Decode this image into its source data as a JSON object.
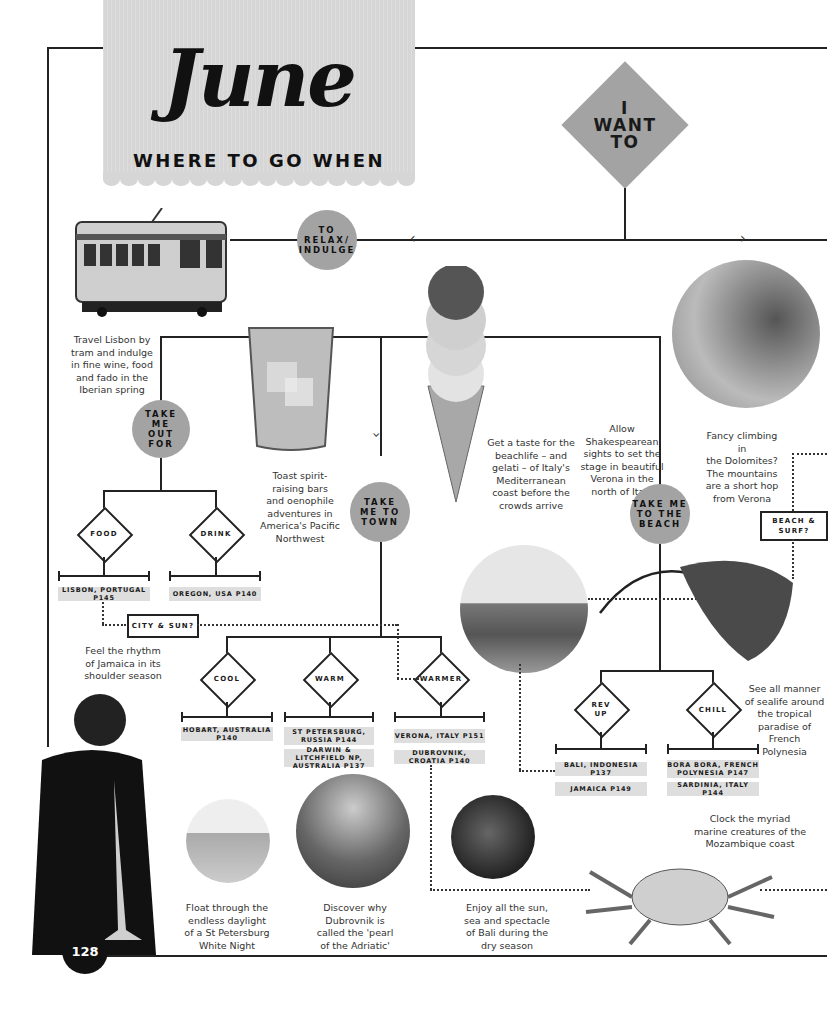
{
  "header": {
    "month": "June",
    "subtitle": "WHERE TO GO WHEN"
  },
  "start": {
    "label": "I\nWANT\nTO"
  },
  "branches": {
    "relax": "TO\nRELAX/\nINDULGE",
    "out_for": "TAKE\nME\nOUT\nFOR",
    "town": "TAKE\nME TO\nTOWN",
    "beach": "TAKE ME\nTO THE\nBEACH"
  },
  "choices": {
    "food": "FOOD",
    "drink": "DRINK",
    "cool": "COOL",
    "warm": "WARM",
    "warmer": "WARMER",
    "rev_up": "REV\nUP",
    "chill": "CHILL"
  },
  "questions": {
    "city_sun": "CITY & SUN?",
    "beach_surf": "BEACH &\nSURF?"
  },
  "destinations": {
    "food": [
      "LISBON, PORTUGAL P145"
    ],
    "drink": [
      "OREGON, USA P140"
    ],
    "cool": [
      "HOBART, AUSTRALIA P140"
    ],
    "warm": [
      "ST PETERSBURG,\nRUSSIA P144",
      "DARWIN & LITCHFIELD NP,\nAUSTRALIA P137"
    ],
    "warmer": [
      "VERONA, ITALY P151",
      "DUBROVNIK, CROATIA P140"
    ],
    "rev_up": [
      "BALI, INDONESIA P137",
      "JAMAICA P149"
    ],
    "chill": [
      "BORA BORA, FRENCH\nPOLYNESIA P147",
      "SARDINIA, ITALY P144"
    ]
  },
  "captions": {
    "lisbon": "Travel Lisbon by\ntram and indulge\nin fine wine, food\nand fado in the\nIberian spring",
    "oregon": "Toast spirit-\nraising bars\nand oenophile\nadventures in\nAmerica's Pacific\nNorthwest",
    "sardinia": "Get a taste for the\nbeachlife – and\ngelati – of Italy's\nMediterranean\ncoast before the\ncrowds arrive",
    "verona": "Allow\nShakespearean\nsights to set the\nstage in beautiful\nVerona in the\nnorth of Italy",
    "dolomites": "Fancy climbing in\nthe Dolomites?\nThe mountains\nare a short hop\nfrom Verona",
    "jamaica": "Feel the rhythm\nof Jamaica in its\nshoulder season",
    "polynesia": "See all manner\nof sealife around\nthe tropical\nparadise of French\nPolynesia",
    "mozambique": "Clock the myriad\nmarine creatures of the\nMozambique coast",
    "stpetersburg": "Float through the\nendless daylight\nof a St Petersburg\nWhite Night",
    "dubrovnik": "Discover why\nDubrovnik is\ncalled the 'pearl\nof the Adriatic'",
    "bali": "Enjoy all the sun,\nsea and spectacle\nof Bali during the\ndry season"
  },
  "page_number": "128",
  "colors": {
    "banner": "#d6d6d6",
    "node": "#a3a3a3",
    "dest": "#dedede",
    "ink": "#222222"
  }
}
